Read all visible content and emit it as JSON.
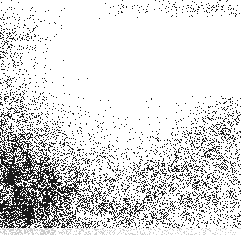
{
  "figure": {
    "width": 241,
    "height": 235,
    "background_color": "#ffffff",
    "point_color": "#1a1a1a",
    "point_size_px": 1,
    "title": "",
    "axis_visible": false,
    "gridlines": false,
    "legend": false,
    "border": false
  },
  "chart_data": {
    "type": "scatter",
    "title": "",
    "xlabel": "",
    "ylabel": "",
    "xlim": [
      0,
      241
    ],
    "ylim": [
      0,
      235
    ],
    "grid": false,
    "legend_position": "none",
    "marker": {
      "shape": "square",
      "size_px": 1,
      "color": "#1a1a1a"
    },
    "series": [
      {
        "name": "point-cloud",
        "approx_point_count": 9600,
        "encoding": "density-field",
        "note": "Point positions are generated from the density field below rather than enumerated; the field reproduces the observed spatial distribution."
      }
    ],
    "density_field": {
      "description": "Probability of a dot per pixel, sampled on a coarse grid. Rows top->bottom (y), columns left->right (x). Values 0..1.",
      "grid_cols": 12,
      "grid_rows": 12,
      "cell_width_px": 20.08,
      "cell_height_px": 19.58,
      "values": [
        [
          0.05,
          0.03,
          0.01,
          0.0,
          0.0,
          0.01,
          0.02,
          0.03,
          0.04,
          0.05,
          0.04,
          0.05
        ],
        [
          0.09,
          0.04,
          0.01,
          0.0,
          0.0,
          0.0,
          0.0,
          0.0,
          0.0,
          0.0,
          0.0,
          0.0
        ],
        [
          0.11,
          0.05,
          0.01,
          0.0,
          0.0,
          0.0,
          0.0,
          0.0,
          0.0,
          0.0,
          0.0,
          0.0
        ],
        [
          0.13,
          0.06,
          0.02,
          0.0,
          0.0,
          0.0,
          0.0,
          0.0,
          0.0,
          0.0,
          0.0,
          0.0
        ],
        [
          0.16,
          0.08,
          0.03,
          0.01,
          0.0,
          0.0,
          0.0,
          0.0,
          0.0,
          0.0,
          0.01,
          0.01
        ],
        [
          0.22,
          0.12,
          0.05,
          0.02,
          0.01,
          0.01,
          0.01,
          0.01,
          0.01,
          0.02,
          0.03,
          0.04
        ],
        [
          0.3,
          0.18,
          0.09,
          0.04,
          0.02,
          0.02,
          0.02,
          0.03,
          0.04,
          0.06,
          0.08,
          0.09
        ],
        [
          0.4,
          0.26,
          0.14,
          0.07,
          0.05,
          0.05,
          0.06,
          0.07,
          0.08,
          0.1,
          0.12,
          0.12
        ],
        [
          0.47,
          0.36,
          0.22,
          0.13,
          0.09,
          0.09,
          0.1,
          0.11,
          0.12,
          0.14,
          0.15,
          0.14
        ],
        [
          0.5,
          0.44,
          0.3,
          0.19,
          0.13,
          0.12,
          0.13,
          0.14,
          0.15,
          0.17,
          0.18,
          0.16
        ],
        [
          0.48,
          0.45,
          0.34,
          0.23,
          0.16,
          0.14,
          0.15,
          0.16,
          0.17,
          0.19,
          0.2,
          0.18
        ],
        [
          0.4,
          0.38,
          0.3,
          0.21,
          0.15,
          0.13,
          0.14,
          0.15,
          0.16,
          0.17,
          0.17,
          0.15
        ]
      ]
    },
    "features": [
      {
        "name": "top-edge-band",
        "y_range_px": [
          3,
          14
        ],
        "x_range_px": [
          118,
          238
        ],
        "density": 0.1,
        "note": "Narrow horizontal scatter band across the upper-right, separated from the main mass by white space."
      },
      {
        "name": "top-left-cluster",
        "y_range_px": [
          12,
          60
        ],
        "x_range_px": [
          0,
          40
        ],
        "density": 0.07,
        "note": "Sparse vertical trail of dots hugging the left edge."
      },
      {
        "name": "dense-core",
        "center_px": [
          38,
          196
        ],
        "radius_px": 62,
        "density": 0.5,
        "note": "Darkest region, lower-left corner, near 50 percent pixel coverage."
      },
      {
        "name": "white-void",
        "x_range_px": [
          105,
          241
        ],
        "y_range_px": [
          18,
          95
        ],
        "density": 0.004,
        "note": "Large near-empty area in the upper-right quadrant."
      },
      {
        "name": "diagonal-ridge",
        "from_px": [
          120,
          220
        ],
        "to_px": [
          238,
          118
        ],
        "density": 0.14,
        "note": "Medium-density streak climbing from the lower-centre toward the right edge."
      },
      {
        "name": "faded-bottom-strip",
        "y_range_px": [
          228,
          235
        ],
        "opacity": 0.22,
        "note": "Bottom rows render as light gray rather than black."
      }
    ]
  }
}
